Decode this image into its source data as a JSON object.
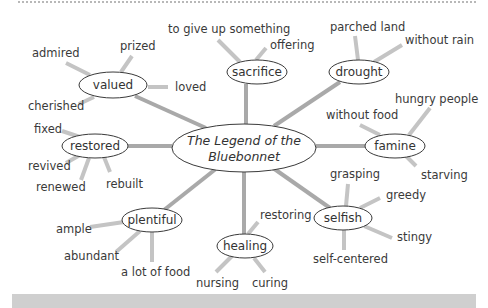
{
  "diagram": {
    "type": "word web",
    "colors": {
      "spoke": "#a9a9a9",
      "leaf_line": "#c4c4c4",
      "outline": "#3a3a3a",
      "text": "#333333",
      "bottom_bar": "#cfcfcf"
    },
    "center": {
      "line1": "The Legend of the",
      "line2": "Bluebonnet",
      "cx": 244,
      "cy": 148,
      "rx": 72,
      "ry": 24
    },
    "nodes": [
      {
        "id": "valued",
        "label": "valued",
        "cx": 113,
        "cy": 85,
        "rx": 34,
        "ry": 13,
        "spoke_from": [
          206,
          128
        ],
        "spoke_to": [
          135,
          96
        ],
        "leaves": [
          {
            "label": "admired",
            "x": 32,
            "y": 53,
            "anchor": "start",
            "line": [
              [
                66,
                63
              ],
              [
                90,
                75
              ]
            ]
          },
          {
            "label": "prized",
            "x": 120,
            "y": 46,
            "anchor": "start",
            "line": [
              [
                132,
                56
              ],
              [
                121,
                72
              ]
            ]
          },
          {
            "label": "loved",
            "x": 175,
            "y": 87,
            "anchor": "start",
            "line": [
              [
                148,
                87
              ],
              [
                168,
                87
              ]
            ]
          },
          {
            "label": "cherished",
            "x": 28,
            "y": 106,
            "anchor": "start",
            "line": [
              [
                79,
                104
              ],
              [
                94,
                97
              ]
            ]
          }
        ]
      },
      {
        "id": "sacrifice",
        "label": "sacrifice",
        "cx": 257,
        "cy": 72,
        "rx": 30,
        "ry": 12,
        "spoke_from": [
          246,
          124
        ],
        "spoke_to": [
          246,
          84
        ],
        "leaves": [
          {
            "label": "to give up something",
            "x": 168,
            "y": 29,
            "anchor": "start",
            "line": [
              [
                218,
                40
              ],
              [
                240,
                62
              ]
            ]
          },
          {
            "label": "offering",
            "x": 270,
            "y": 45,
            "anchor": "start",
            "line": [
              [
                266,
                48
              ],
              [
                256,
                60
              ]
            ]
          }
        ]
      },
      {
        "id": "drought",
        "label": "drought",
        "cx": 359,
        "cy": 72,
        "rx": 30,
        "ry": 12,
        "spoke_from": [
          274,
          126
        ],
        "spoke_to": [
          340,
          82
        ],
        "leaves": [
          {
            "label": "parched land",
            "x": 330,
            "y": 27,
            "anchor": "start",
            "line": [
              [
                355,
                36
              ],
              [
                358,
                60
              ]
            ]
          },
          {
            "label": "without rain",
            "x": 405,
            "y": 40,
            "anchor": "start",
            "line": [
              [
                402,
                45
              ],
              [
                374,
                62
              ]
            ]
          }
        ]
      },
      {
        "id": "famine",
        "label": "famine",
        "cx": 395,
        "cy": 146,
        "rx": 30,
        "ry": 12,
        "spoke_from": [
          316,
          146
        ],
        "spoke_to": [
          365,
          146
        ],
        "leaves": [
          {
            "label": "without food",
            "x": 326,
            "y": 115,
            "anchor": "start",
            "line": [
              [
                360,
                125
              ],
              [
                380,
                135
              ]
            ]
          },
          {
            "label": "hungry people",
            "x": 395,
            "y": 99,
            "anchor": "start",
            "line": [
              [
                430,
                108
              ],
              [
                409,
                135
              ]
            ]
          },
          {
            "label": "starving",
            "x": 421,
            "y": 175,
            "anchor": "start",
            "line": [
              [
                416,
                166
              ],
              [
                406,
                156
              ]
            ]
          }
        ]
      },
      {
        "id": "restored",
        "label": "restored",
        "cx": 95,
        "cy": 146,
        "rx": 33,
        "ry": 12,
        "spoke_from": [
          128,
          146
        ],
        "spoke_to": [
          172,
          146
        ],
        "leaves": [
          {
            "label": "fixed",
            "x": 34,
            "y": 129,
            "anchor": "start",
            "line": [
              [
                62,
                131
              ],
              [
                80,
                137
              ]
            ]
          },
          {
            "label": "revived",
            "x": 28,
            "y": 166,
            "anchor": "start",
            "line": [
              [
                66,
                163
              ],
              [
                80,
                155
              ]
            ]
          },
          {
            "label": "renewed",
            "x": 36,
            "y": 187,
            "anchor": "start",
            "line": [
              [
                81,
                180
              ],
              [
                89,
                158
              ]
            ]
          },
          {
            "label": "rebuilt",
            "x": 106,
            "y": 184,
            "anchor": "start",
            "line": [
              [
                110,
                172
              ],
              [
                104,
                157
              ]
            ]
          }
        ]
      },
      {
        "id": "plentiful",
        "label": "plentiful",
        "cx": 152,
        "cy": 220,
        "rx": 30,
        "ry": 12,
        "spoke_from": [
          217,
          168
        ],
        "spoke_to": [
          164,
          210
        ],
        "leaves": [
          {
            "label": "ample",
            "x": 56,
            "y": 229,
            "anchor": "start",
            "line": [
              [
                90,
                227
              ],
              [
                124,
                222
              ]
            ]
          },
          {
            "label": "abundant",
            "x": 64,
            "y": 256,
            "anchor": "start",
            "line": [
              [
                116,
                252
              ],
              [
                140,
                231
              ]
            ]
          },
          {
            "label": "a lot of food",
            "x": 121,
            "y": 272,
            "anchor": "start",
            "line": [
              [
                152,
                262
              ],
              [
                152,
                232
              ]
            ]
          }
        ]
      },
      {
        "id": "healing",
        "label": "healing",
        "cx": 245,
        "cy": 246,
        "rx": 28,
        "ry": 12,
        "spoke_from": [
          244,
          172
        ],
        "spoke_to": [
          244,
          234
        ],
        "leaves": [
          {
            "label": "restoring",
            "x": 260,
            "y": 215,
            "anchor": "start",
            "line": [
              [
                258,
                222
              ],
              [
                248,
                234
              ]
            ]
          },
          {
            "label": "nursing",
            "x": 196,
            "y": 283,
            "anchor": "start",
            "line": [
              [
                216,
                272
              ],
              [
                232,
                256
              ]
            ]
          },
          {
            "label": "curing",
            "x": 252,
            "y": 283,
            "anchor": "start",
            "line": [
              [
                265,
                272
              ],
              [
                254,
                258
              ]
            ]
          }
        ]
      },
      {
        "id": "selfish",
        "label": "selfish",
        "cx": 343,
        "cy": 218,
        "rx": 29,
        "ry": 12,
        "spoke_from": [
          273,
          168
        ],
        "spoke_to": [
          330,
          208
        ],
        "leaves": [
          {
            "label": "grasping",
            "x": 330,
            "y": 174,
            "anchor": "start",
            "line": [
              [
                348,
                184
              ],
              [
                346,
                206
              ]
            ]
          },
          {
            "label": "greedy",
            "x": 386,
            "y": 195,
            "anchor": "start",
            "line": [
              [
                380,
                198
              ],
              [
                360,
                208
              ]
            ]
          },
          {
            "label": "stingy",
            "x": 397,
            "y": 237,
            "anchor": "start",
            "line": [
              [
                392,
                238
              ],
              [
                364,
                226
              ]
            ]
          },
          {
            "label": "self-centered",
            "x": 313,
            "y": 259,
            "anchor": "start",
            "line": [
              [
                344,
                250
              ],
              [
                344,
                230
              ]
            ]
          }
        ]
      }
    ]
  }
}
